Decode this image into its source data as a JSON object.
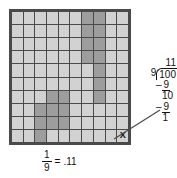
{
  "figure": {
    "title_text": "",
    "grid": {
      "rows": 10,
      "cols": 10,
      "cell_color": "#d2d2d2",
      "shaded_color": "#9d9d9d",
      "border_color": "#4a4a4a",
      "marked_cell": {
        "row": 10,
        "col": 10,
        "label": "X"
      },
      "shaded_cells": [
        [
          1,
          7
        ],
        [
          1,
          8
        ],
        [
          2,
          7
        ],
        [
          2,
          8
        ],
        [
          3,
          7
        ],
        [
          3,
          8
        ],
        [
          4,
          7
        ],
        [
          4,
          8
        ],
        [
          5,
          8
        ],
        [
          6,
          8
        ],
        [
          7,
          4
        ],
        [
          7,
          5
        ],
        [
          7,
          8
        ],
        [
          8,
          3
        ],
        [
          8,
          4
        ],
        [
          8,
          5
        ],
        [
          9,
          3
        ],
        [
          9,
          4
        ],
        [
          9,
          5
        ],
        [
          10,
          3
        ]
      ]
    },
    "bottom_label": {
      "fraction_numerator": "1",
      "fraction_denominator": "9",
      "equals": "=",
      "decimal": ".11"
    },
    "long_division": {
      "quotient": "11",
      "divisor": "9",
      "dividend": "100",
      "step1_minus": "–",
      "step1_value": "9",
      "step2_bring_down": "10",
      "step3_minus": "–",
      "step3_value": "9",
      "remainder": "1"
    }
  }
}
